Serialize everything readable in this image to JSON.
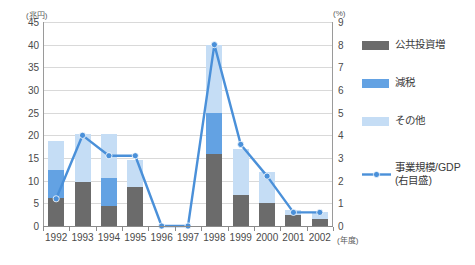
{
  "chart_data": {
    "type": "bar",
    "title": "",
    "subtitle": "",
    "xlabel": "(年度)",
    "ylabel": "(兆円)",
    "y2label": "(%)",
    "ylim": [
      0,
      45
    ],
    "y2lim": [
      0,
      9
    ],
    "ytick_step": 5,
    "y2tick_step": 1,
    "grid": true,
    "legend_position": "right",
    "categories": [
      "1992",
      "1993",
      "1994",
      "1995",
      "1996",
      "1997",
      "1998",
      "1999",
      "2000",
      "2001",
      "2002"
    ],
    "yticks": [
      "0",
      "5",
      "10",
      "15",
      "20",
      "25",
      "30",
      "35",
      "40",
      "45"
    ],
    "y2ticks": [
      "0",
      "1",
      "2",
      "3",
      "4",
      "5",
      "6",
      "7",
      "8",
      "9"
    ],
    "stacked": true,
    "series": [
      {
        "name": "公共投資増",
        "axis": "left",
        "color": "#6b6b6b",
        "values": [
          6.1,
          9.6,
          4.4,
          8.6,
          0,
          0,
          15.8,
          6.8,
          5.0,
          2.5,
          1.5
        ]
      },
      {
        "name": "減税",
        "axis": "left",
        "color": "#63a2e3",
        "values": [
          6.3,
          0,
          6.1,
          0,
          0,
          0,
          9.2,
          0,
          0,
          0,
          0
        ]
      },
      {
        "name": "その他",
        "axis": "left",
        "color": "#c5ddf5",
        "values": [
          6.3,
          10.6,
          9.8,
          5.9,
          0,
          0,
          15.0,
          10.2,
          7.0,
          1.0,
          1.5
        ]
      },
      {
        "name": "事業規模/GDP",
        "axis": "right",
        "type": "line",
        "color": "#4a90d9",
        "label_sub": "(右目盛)",
        "values": [
          1.2,
          4.0,
          3.1,
          3.1,
          0.0,
          0.0,
          8.0,
          3.6,
          2.2,
          0.6,
          0.6
        ]
      }
    ],
    "legend": [
      {
        "label": "公共投資増",
        "swatch": "#6b6b6b",
        "kind": "box"
      },
      {
        "label": "減税",
        "swatch": "#63a2e3",
        "kind": "box"
      },
      {
        "label": "その他",
        "swatch": "#c5ddf5",
        "kind": "box"
      },
      {
        "label": "事業規模/GDP",
        "sub": "(右目盛)",
        "swatch": "#4a90d9",
        "kind": "line"
      }
    ]
  }
}
